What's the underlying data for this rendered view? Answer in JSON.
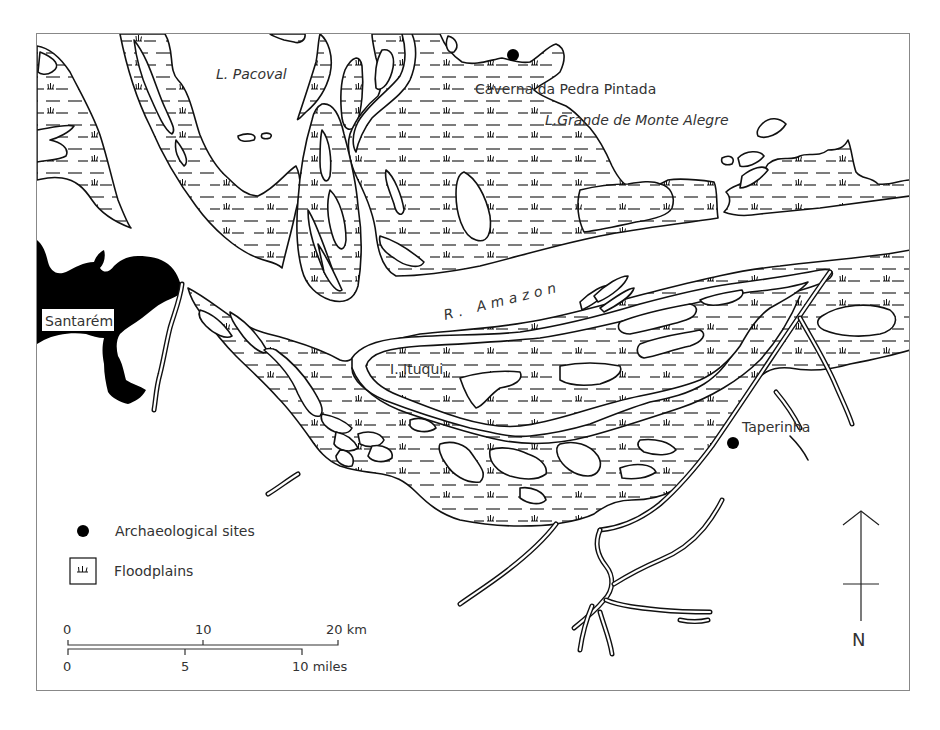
{
  "map": {
    "frame": {
      "x": 36,
      "y": 33,
      "width": 874,
      "height": 658,
      "border_color": "#888888"
    },
    "colors": {
      "ink": "#111111",
      "label": "#333333",
      "urban": "#000000",
      "background": "#ffffff"
    },
    "labels": {
      "pacoval": "L. Pacoval",
      "caverna": "Caverna da Pedra Pintada",
      "monte_alegre": "L.Grande de Monte Alegre",
      "amazon": "R. Amazon",
      "santarem": "Santarém",
      "ituqui": "I. Ituqui",
      "taperinha": "Taperinha"
    },
    "sites": [
      {
        "name": "Caverna da Pedra Pintada",
        "x": 513,
        "y": 55
      },
      {
        "name": "Taperinha",
        "x": 733,
        "y": 443
      }
    ],
    "legend": {
      "items": [
        {
          "symbol": "dot",
          "label": "Archaeological sites"
        },
        {
          "symbol": "marsh-box",
          "label": "Floodplains"
        }
      ]
    },
    "scale": {
      "km": {
        "ticks": [
          "0",
          "10",
          "20 km"
        ]
      },
      "miles": {
        "ticks": [
          "0",
          "5",
          "10 miles"
        ]
      }
    },
    "north_arrow": {
      "label": "N"
    }
  }
}
